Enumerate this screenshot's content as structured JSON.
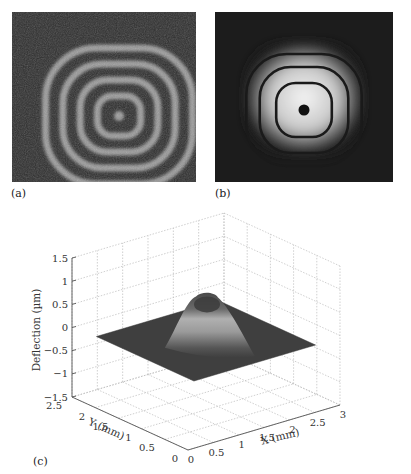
{
  "panels": {
    "a": {
      "label": "(a)",
      "description": "speckle interferogram with concentric fringes"
    },
    "b": {
      "label": "(b)",
      "description": "filtered fringe pattern with concentric rings"
    },
    "c": {
      "label": "(c)"
    }
  },
  "chart_data": {
    "type": "surface",
    "title": "",
    "xlabel": "X (mm)",
    "ylabel": "Y (mm)",
    "zlabel": "Deflection (µm)",
    "x_ticks": [
      "0",
      "0.5",
      "1",
      "1.5",
      "2",
      "2.5",
      "3"
    ],
    "y_ticks": [
      "0",
      "0.5",
      "1",
      "1.5",
      "2",
      "2.5"
    ],
    "z_ticks": [
      "1.5",
      "1",
      "0.5",
      "0",
      "-0.5",
      "-1",
      "-1.5"
    ],
    "xlim": [
      0,
      3
    ],
    "ylim": [
      0,
      2.5
    ],
    "zlim": [
      -1.5,
      1.5
    ],
    "grid": true,
    "surface": {
      "shape": "gaussian-like bump on flat square plate",
      "plate_level": -0.2,
      "peak_value": 0.8,
      "peak_center": [
        1.5,
        1.25
      ],
      "plate_extent_x": [
        0.3,
        2.7
      ],
      "plate_extent_y": [
        0.2,
        2.3
      ]
    },
    "fringe_rings_a": 4,
    "fringe_rings_b": 3
  }
}
